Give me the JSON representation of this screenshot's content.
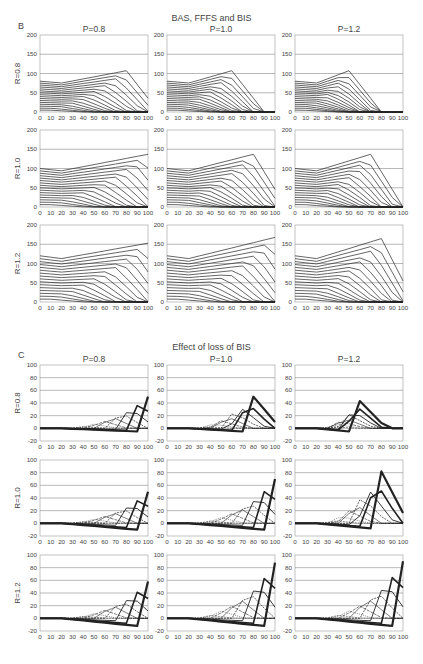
{
  "figure": {
    "section_b": {
      "letter": "B",
      "title": "BAS, FFFS and BIS"
    },
    "section_c": {
      "letter": "C",
      "title": "Effect of loss of BIS"
    },
    "caption": "Figure ..."
  },
  "chart_data": [
    {
      "id": "B",
      "type": "line",
      "title": "BAS, FFFS and BIS",
      "columns": [
        "P=0.8",
        "P=1.0",
        "P=1.2"
      ],
      "rows": [
        "R=0.8",
        "R=1.0",
        "R=1.2"
      ],
      "x": [
        0,
        10,
        20,
        30,
        40,
        50,
        60,
        70,
        80,
        90,
        100
      ],
      "xticks": [
        "0",
        "10",
        "20",
        "30",
        "40",
        "50",
        "60",
        "70",
        "80",
        "90",
        "100"
      ],
      "ylim": [
        0,
        200
      ],
      "yticks": [
        "0",
        "50",
        "100",
        "150",
        "200"
      ],
      "grid": true,
      "panels": [
        {
          "row": "R=0.8",
          "col": "P=0.8",
          "top_start": 80,
          "top_end_peak": 112,
          "peak_x": 80,
          "end": 65
        },
        {
          "row": "R=0.8",
          "col": "P=1.0",
          "top_start": 80,
          "top_end_peak": 112,
          "peak_x": 60,
          "end": 0
        },
        {
          "row": "R=0.8",
          "col": "P=1.2",
          "top_start": 80,
          "top_end_peak": 112,
          "peak_x": 50,
          "end": 0
        },
        {
          "row": "R=1.0",
          "col": "P=0.8",
          "top_start": 100,
          "top_end_peak": 143,
          "peak_x": 100,
          "end": 143
        },
        {
          "row": "R=1.0",
          "col": "P=1.0",
          "top_start": 100,
          "top_end_peak": 143,
          "peak_x": 80,
          "end": 82
        },
        {
          "row": "R=1.0",
          "col": "P=1.2",
          "top_start": 100,
          "top_end_peak": 143,
          "peak_x": 70,
          "end": 0
        },
        {
          "row": "R=1.2",
          "col": "P=0.8",
          "top_start": 120,
          "top_end_peak": 160,
          "peak_x": 100,
          "end": 160
        },
        {
          "row": "R=1.2",
          "col": "P=1.0",
          "top_start": 120,
          "top_end_peak": 175,
          "peak_x": 100,
          "end": 175
        },
        {
          "row": "R=1.2",
          "col": "P=1.2",
          "top_start": 120,
          "top_end_peak": 172,
          "peak_x": 80,
          "end": 97
        }
      ]
    },
    {
      "id": "C",
      "type": "line",
      "title": "Effect of loss of BIS",
      "columns": [
        "P=0.8",
        "P=1.0",
        "P=1.2"
      ],
      "rows": [
        "R=0.8",
        "R=1.0",
        "R=1.2"
      ],
      "x": [
        0,
        10,
        20,
        30,
        40,
        50,
        60,
        70,
        80,
        90,
        100
      ],
      "xticks": [
        "0",
        "10",
        "20",
        "30",
        "40",
        "50",
        "60",
        "70",
        "80",
        "90",
        "100"
      ],
      "ylim": [
        -20,
        100
      ],
      "yticks": [
        "-20",
        "0",
        "20",
        "40",
        "60",
        "80",
        "100"
      ],
      "grid": true,
      "panels": [
        {
          "row": "R=0.8",
          "col": "P=0.8",
          "max_peak": 50,
          "max_peak_x": 100,
          "min_dip": -5
        },
        {
          "row": "R=0.8",
          "col": "P=1.0",
          "max_peak": 50,
          "max_peak_x": 80,
          "min_dip": -5
        },
        {
          "row": "R=0.8",
          "col": "P=1.2",
          "max_peak": 43,
          "max_peak_x": 60,
          "min_dip": -5
        },
        {
          "row": "R=1.0",
          "col": "P=0.8",
          "max_peak": 50,
          "max_peak_x": 100,
          "min_dip": -10
        },
        {
          "row": "R=1.0",
          "col": "P=1.0",
          "max_peak": 70,
          "max_peak_x": 100,
          "min_dip": -10
        },
        {
          "row": "R=1.0",
          "col": "P=1.2",
          "max_peak": 82,
          "max_peak_x": 80,
          "min_dip": -8
        },
        {
          "row": "R=1.2",
          "col": "P=0.8",
          "max_peak": 58,
          "max_peak_x": 100,
          "min_dip": -12
        },
        {
          "row": "R=1.2",
          "col": "P=1.0",
          "max_peak": 88,
          "max_peak_x": 100,
          "min_dip": -12
        },
        {
          "row": "R=1.2",
          "col": "P=1.2",
          "max_peak": 90,
          "max_peak_x": 100,
          "min_dip": -12
        }
      ]
    }
  ]
}
